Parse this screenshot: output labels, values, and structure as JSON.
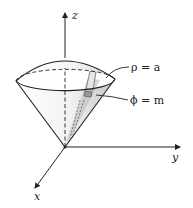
{
  "diagram": {
    "type": "3d-coordinate-surface",
    "axes": {
      "z_label": "z",
      "y_label": "y",
      "x_label": "x"
    },
    "surfaces": [
      {
        "name": "sphere",
        "label": "ρ = a"
      },
      {
        "name": "cone",
        "label": "ϕ = m"
      }
    ],
    "colors": {
      "stroke": "#222222",
      "shade_light": "#efefef",
      "shade_dark": "#bdbdbd",
      "background": "#ffffff"
    }
  }
}
